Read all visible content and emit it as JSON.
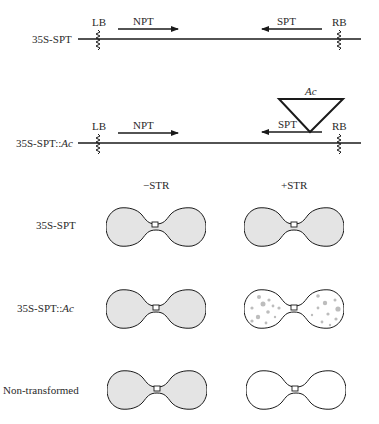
{
  "constructs": [
    {
      "name": "35S-SPT",
      "name_plain": "35S-SPT",
      "left_border": "LB",
      "right_border": "RB",
      "forward_gene": "NPT",
      "reverse_gene": "SPT"
    },
    {
      "name": "35S-SPT::Ac",
      "name_prefix": "35S-SPT::",
      "name_italic": "Ac",
      "left_border": "LB",
      "right_border": "RB",
      "forward_gene": "NPT",
      "reverse_gene": "SPT",
      "insertion": "Ac"
    }
  ],
  "columns": [
    "−STR",
    "+STR"
  ],
  "rows": [
    {
      "label_prefix": "35S-SPT",
      "label_italic": "",
      "minus_str": "green",
      "plus_str": "green"
    },
    {
      "label_prefix": "35S-SPT::",
      "label_italic": "Ac",
      "minus_str": "green",
      "plus_str": "variegated"
    },
    {
      "label_prefix": "Non-transformed",
      "label_italic": "",
      "minus_str": "green",
      "plus_str": "white"
    }
  ],
  "colors": {
    "line": "#1a1a1a",
    "cotyledon_fill": "#e4e4e4",
    "white_fill": "#ffffff",
    "spot": "#b8b8b8"
  }
}
